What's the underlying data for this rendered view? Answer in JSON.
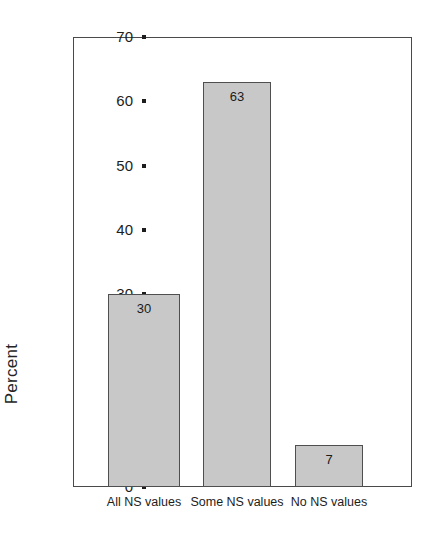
{
  "chart_data": {
    "type": "bar",
    "title": "",
    "xlabel": "",
    "ylabel": "Percent",
    "categories": [
      "All NS values",
      "Some NS values",
      "No NS values"
    ],
    "values": [
      30,
      63,
      6.5
    ],
    "data_labels": [
      "30",
      "63",
      "7"
    ],
    "ylim": [
      0,
      70
    ],
    "yticks": [
      "0",
      "10",
      "20",
      "30",
      "40",
      "50",
      "60",
      "70"
    ],
    "ytick_values": [
      0,
      10,
      20,
      30,
      40,
      50,
      60,
      70
    ],
    "grid": false,
    "legend": "none",
    "bar_color": "#c8c8c8",
    "bar_border_color": "#4f4f4f",
    "axis_color": "#4a4a4a",
    "background": "#ffffff"
  }
}
